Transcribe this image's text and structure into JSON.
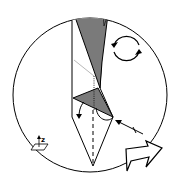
{
  "diagram": {
    "type": "origami-fold-step",
    "axis_label": "z",
    "colors": {
      "line": "#000000",
      "paper_back": "#7a7a7a",
      "background": "#ffffff"
    },
    "symbols": [
      "rotate-icon",
      "hollow-arrow-icon",
      "push-arrow-icon",
      "axis-plane-icon",
      "fold-arrow-icon",
      "valley-fold-line"
    ]
  }
}
